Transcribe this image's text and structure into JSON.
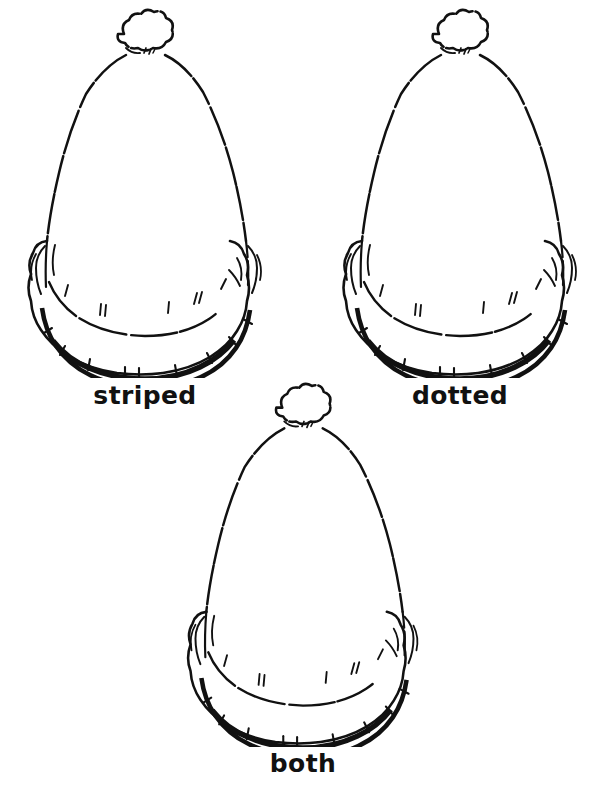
{
  "page": {
    "background_color": "#ffffff",
    "ink_color": "#111111",
    "width": 605,
    "height": 792,
    "style": "black-and-white line art"
  },
  "figures": [
    {
      "id": "striped",
      "label": "striped",
      "icon_name": "winter-hat-with-pompom-icon",
      "position": "top-left"
    },
    {
      "id": "dotted",
      "label": "dotted",
      "icon_name": "winter-hat-with-pompom-icon",
      "position": "top-right"
    },
    {
      "id": "both",
      "label": "both",
      "icon_name": "winter-hat-with-pompom-icon",
      "position": "bottom-center"
    }
  ]
}
